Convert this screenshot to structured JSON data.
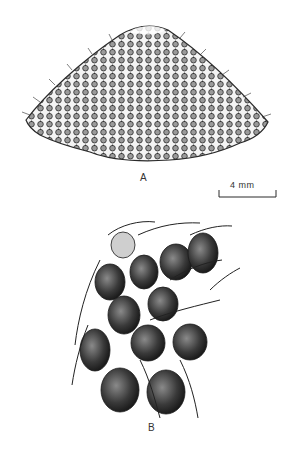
{
  "figure": {
    "panel_a": {
      "label": "A",
      "description": "dome-shaped structure covered with rows of rounded cells and bristles"
    },
    "panel_b": {
      "label": "B",
      "description": "enlarged cluster of dark ovoid cells each bearing a long curved bristle"
    },
    "scale_bar": {
      "text": "4 mm"
    }
  },
  "colors": {
    "ink": "#2a2a2a",
    "paper": "#ffffff",
    "shade": "#555555"
  }
}
